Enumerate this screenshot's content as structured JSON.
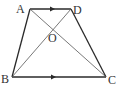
{
  "diagram": {
    "type": "trapezoid",
    "colors": {
      "stroke": "#2a2a2a",
      "diagonal": "#555555",
      "label": "#333333"
    },
    "points": {
      "A": {
        "label": "A",
        "x": 30,
        "y": 9
      },
      "D": {
        "label": "D",
        "x": 71,
        "y": 9
      },
      "B": {
        "label": "B",
        "x": 12,
        "y": 77
      },
      "C": {
        "label": "C",
        "x": 106,
        "y": 77
      },
      "O": {
        "label": "O",
        "x": 54,
        "y": 29
      }
    },
    "parallel_marks": [
      "AD",
      "BC"
    ]
  }
}
